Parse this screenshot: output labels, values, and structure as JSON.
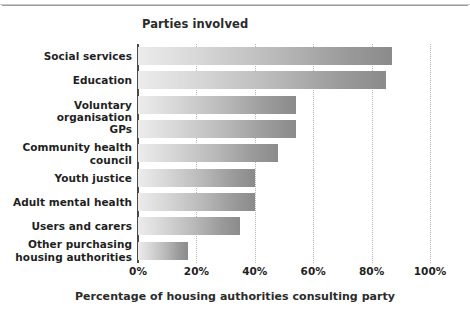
{
  "chart_data": {
    "type": "bar",
    "orientation": "horizontal",
    "title": "Parties involved",
    "xlabel": "Percentage of housing authorities consulting party",
    "ylabel": "",
    "xlim": [
      0,
      100
    ],
    "xticks": [
      0,
      20,
      40,
      60,
      80,
      100
    ],
    "xtick_labels": [
      "0%",
      "20%",
      "40%",
      "60%",
      "80%",
      "100%"
    ],
    "grid": "vertical-dotted",
    "legend": null,
    "bar_fill": "horizontal-gradient-light-to-dark-gray",
    "bar_color_start": "#ececec",
    "bar_color_end": "#8b8b8b",
    "axis_color": "#4a4a4a",
    "categories": [
      "Social services",
      "Education",
      "Voluntary organisation",
      "GPs",
      "Community health council",
      "Youth justice",
      "Adult mental health",
      "Users and carers",
      "Other purchasing housing authorities"
    ],
    "category_lines": [
      [
        "Social services"
      ],
      [
        "Education"
      ],
      [
        "Voluntary organisation"
      ],
      [
        "GPs"
      ],
      [
        "Community health",
        "council"
      ],
      [
        "Youth justice"
      ],
      [
        "Adult mental health"
      ],
      [
        "Users and carers"
      ],
      [
        "Other purchasing",
        "housing authorities"
      ]
    ],
    "values": [
      87,
      85,
      54,
      54,
      48,
      40,
      40,
      35,
      17
    ]
  }
}
